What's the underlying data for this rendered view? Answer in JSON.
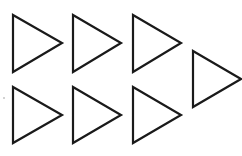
{
  "figure": {
    "width": 242,
    "height": 156,
    "background": "#ffffff",
    "stroke_color": "#1a1a1a",
    "stroke_width": 2.2,
    "shape_count": 7,
    "shapes": [
      {
        "id": "triangle-row1-col1",
        "type": "triangle",
        "direction": "right",
        "points": [
          [
            13,
            15
          ],
          [
            62,
            43
          ],
          [
            13,
            72
          ]
        ]
      },
      {
        "id": "triangle-row1-col2",
        "type": "triangle",
        "direction": "right",
        "points": [
          [
            73,
            15
          ],
          [
            121,
            43
          ],
          [
            73,
            72
          ]
        ]
      },
      {
        "id": "triangle-row1-col3",
        "type": "triangle",
        "direction": "right",
        "points": [
          [
            133,
            15
          ],
          [
            181,
            43
          ],
          [
            133,
            72
          ]
        ]
      },
      {
        "id": "triangle-offset-col4",
        "type": "triangle",
        "direction": "right",
        "points": [
          [
            193,
            51
          ],
          [
            241,
            79
          ],
          [
            193,
            107
          ]
        ]
      },
      {
        "id": "triangle-row2-col1",
        "type": "triangle",
        "direction": "right",
        "points": [
          [
            13,
            87
          ],
          [
            62,
            115
          ],
          [
            13,
            143
          ]
        ]
      },
      {
        "id": "triangle-row2-col2",
        "type": "triangle",
        "direction": "right",
        "points": [
          [
            73,
            87
          ],
          [
            121,
            115
          ],
          [
            73,
            143
          ]
        ]
      },
      {
        "id": "triangle-row2-col3",
        "type": "triangle",
        "direction": "right",
        "points": [
          [
            133,
            87
          ],
          [
            181,
            115
          ],
          [
            133,
            143
          ]
        ]
      }
    ],
    "specks": [
      {
        "x": 4,
        "y": 98,
        "r": 0.8
      }
    ]
  }
}
